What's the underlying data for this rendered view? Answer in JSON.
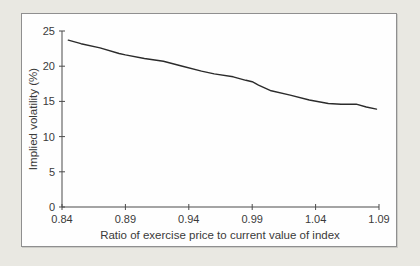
{
  "page": {
    "background_color": "#e9e8e2",
    "panel_background": "#fefefe",
    "panel_border_color": "#8f8f8f"
  },
  "chart_data": {
    "type": "line",
    "title": "",
    "xlabel": "Ratio of exercise price to current value of index",
    "ylabel": "Implied volatility (%)",
    "xlim": [
      0.84,
      1.09
    ],
    "ylim": [
      0,
      25
    ],
    "x_ticks": [
      0.84,
      0.89,
      0.94,
      0.99,
      1.04,
      1.09
    ],
    "x_tick_labels": [
      "0.84",
      "0.89",
      "0.94",
      "0.99",
      "1.04",
      "1.09"
    ],
    "y_ticks": [
      0,
      5,
      10,
      15,
      20,
      25
    ],
    "y_tick_labels": [
      "0",
      "5",
      "10",
      "15",
      "20",
      "25"
    ],
    "grid": false,
    "legend": "none",
    "axis_color": "#4a4a4a",
    "line_color": "#2b2b2b",
    "series": [
      {
        "name": "Implied volatility",
        "points": [
          [
            0.845,
            23.7
          ],
          [
            0.855,
            23.2
          ],
          [
            0.87,
            22.6
          ],
          [
            0.885,
            21.8
          ],
          [
            0.89,
            21.6
          ],
          [
            0.905,
            21.1
          ],
          [
            0.92,
            20.7
          ],
          [
            0.935,
            20.0
          ],
          [
            0.95,
            19.3
          ],
          [
            0.96,
            18.9
          ],
          [
            0.975,
            18.5
          ],
          [
            0.985,
            18.0
          ],
          [
            0.99,
            17.8
          ],
          [
            0.995,
            17.3
          ],
          [
            1.005,
            16.5
          ],
          [
            1.02,
            15.9
          ],
          [
            1.035,
            15.2
          ],
          [
            1.05,
            14.7
          ],
          [
            1.06,
            14.6
          ],
          [
            1.072,
            14.6
          ],
          [
            1.08,
            14.2
          ],
          [
            1.088,
            13.9
          ]
        ]
      }
    ]
  }
}
